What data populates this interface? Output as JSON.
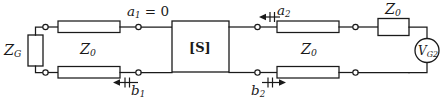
{
  "diagram": {
    "type": "circuit-schematic",
    "colors": {
      "line": "#1a1a1a",
      "background": "#ffffff",
      "fill": "#ffffff"
    },
    "labels": {
      "source_impedance_left": "Z",
      "source_impedance_left_sub": "G",
      "line_impedance_left": "Z",
      "line_impedance_left_sub": "0",
      "line_impedance_right": "Z",
      "line_impedance_right_sub": "0",
      "series_impedance_right": "Z",
      "series_impedance_right_sub": "0",
      "network_block": "[S]",
      "incident_wave_port1": "a",
      "incident_wave_port1_sub": "1",
      "incident_wave_port1_value": " = 0",
      "reflected_wave_port1": "b",
      "reflected_wave_port1_sub": "1",
      "incident_wave_port2": "a",
      "incident_wave_port2_sub": "2",
      "reflected_wave_port2": "b",
      "reflected_wave_port2_sub": "2",
      "voltage_source_right": "V",
      "voltage_source_right_sub": "G2"
    },
    "components": [
      {
        "name": "generator-impedance-zg",
        "kind": "resistor",
        "label": "Z_G"
      },
      {
        "name": "transmission-line-left-top",
        "kind": "transmission-line",
        "label": "Z_0"
      },
      {
        "name": "transmission-line-left-bottom",
        "kind": "transmission-line",
        "label": "Z_0"
      },
      {
        "name": "s-parameter-block",
        "kind": "two-port-block",
        "label": "[S]"
      },
      {
        "name": "transmission-line-right-top",
        "kind": "transmission-line",
        "label": "Z_0"
      },
      {
        "name": "transmission-line-right-bottom",
        "kind": "transmission-line",
        "label": "Z_0"
      },
      {
        "name": "series-impedance-z0-right",
        "kind": "resistor",
        "label": "Z_0"
      },
      {
        "name": "voltage-source-vg2",
        "kind": "voltage-source",
        "label": "V_G2"
      }
    ],
    "wave_arrows": [
      {
        "name": "arrow-a1",
        "direction": "none",
        "note": "a1 = 0, no incident wave at port 1"
      },
      {
        "name": "arrow-b1",
        "direction": "left",
        "label": "b_1"
      },
      {
        "name": "arrow-a2",
        "direction": "left",
        "label": "a_2"
      },
      {
        "name": "arrow-b2",
        "direction": "right",
        "label": "b_2"
      }
    ]
  }
}
